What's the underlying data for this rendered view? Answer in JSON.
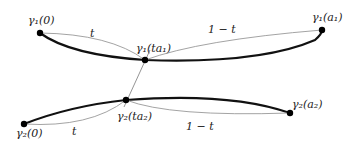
{
  "labels": {
    "g1_start": "γ₁(0)",
    "g1_end": "γ₁(a₁)",
    "g1_mid": "γ₁(ta₁)",
    "g2_start": "γ₂(0)",
    "g2_end": "γ₂(a₂)",
    "g2_mid": "γ₂(ta₂)",
    "t_top": "t",
    "one_minus_t_top": "1 − t",
    "t_bottom": "t",
    "one_minus_t_bottom": "1 − t"
  },
  "colors": {
    "thick_curve": "#111111",
    "thin_curve": "#999999",
    "point": "#000000"
  }
}
